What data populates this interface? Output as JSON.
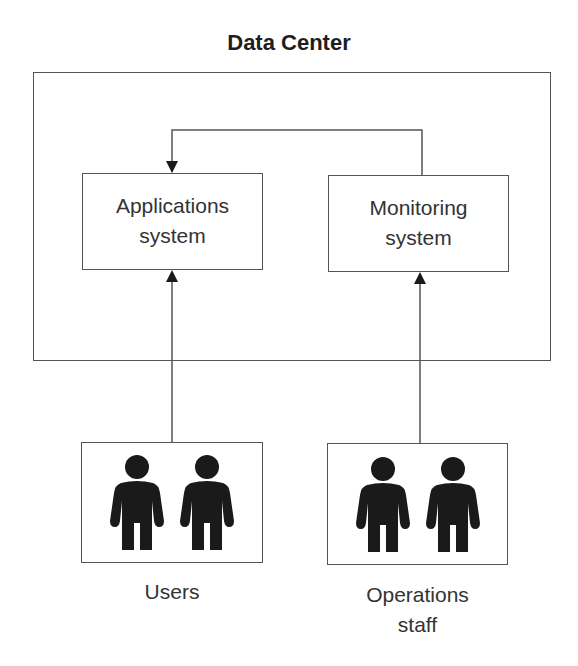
{
  "diagram": {
    "title": "Data Center",
    "nodes": {
      "applications": {
        "line1": "Applications",
        "line2": "system"
      },
      "monitoring": {
        "line1": "Monitoring",
        "line2": "system"
      },
      "users": {
        "label": "Users",
        "icon": "person-icon",
        "count": 2
      },
      "operations": {
        "line1": "Operations",
        "line2": "staff",
        "icon": "person-icon",
        "count": 2
      }
    },
    "edges": [
      {
        "from": "users",
        "to": "applications",
        "type": "arrow"
      },
      {
        "from": "operations",
        "to": "monitoring",
        "type": "arrow"
      },
      {
        "from": "monitoring",
        "to": "applications",
        "type": "arrow"
      }
    ],
    "colors": {
      "stroke": "#555555",
      "text": "#333333",
      "icon": "#1a1a1a"
    }
  }
}
